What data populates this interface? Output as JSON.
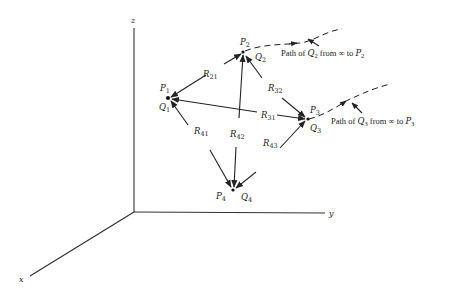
{
  "figure": {
    "axes": {
      "z_label": "z",
      "y_label": "y",
      "x_label": "x"
    },
    "points": [
      {
        "id": "1",
        "p": "P",
        "p_sub": "1",
        "q": "Q",
        "q_sub": "1"
      },
      {
        "id": "2",
        "p": "P",
        "p_sub": "2",
        "q": "Q",
        "q_sub": "2"
      },
      {
        "id": "3",
        "p": "P",
        "p_sub": "3",
        "q": "Q",
        "q_sub": "3"
      },
      {
        "id": "4",
        "p": "P",
        "p_sub": "4",
        "q": "Q",
        "q_sub": "4"
      }
    ],
    "vectors": [
      {
        "name": "R",
        "sub": "21"
      },
      {
        "name": "R",
        "sub": "32"
      },
      {
        "name": "R",
        "sub": "31"
      },
      {
        "name": "R",
        "sub": "41"
      },
      {
        "name": "R",
        "sub": "42"
      },
      {
        "name": "R",
        "sub": "43"
      }
    ],
    "paths": [
      {
        "prefix": "Path of ",
        "q": "Q",
        "q_sub": "2",
        "middle": " from ∞ to ",
        "p": "P",
        "p_sub": "2"
      },
      {
        "prefix": "Path of ",
        "q": "Q",
        "q_sub": "3",
        "middle": " from ∞ to ",
        "p": "P",
        "p_sub": "3"
      }
    ]
  }
}
